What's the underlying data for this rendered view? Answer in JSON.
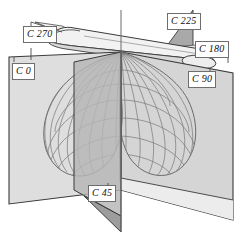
{
  "figure": {
    "background_color": "#ffffff",
    "line_color": "#3a3a3a",
    "mesh_color": "#7b7b7b",
    "plane_fill_light": "#dedede",
    "plane_fill_mid": "#c9c9c9",
    "plane_fill_dark": "#a9a9a9",
    "luminaire_fill": "#e3e3e3"
  },
  "labels": [
    {
      "id": "c270",
      "text": "C 270",
      "x": 23,
      "y": 30
    },
    {
      "id": "c225",
      "text": "C 225",
      "x": 168,
      "y": 17
    },
    {
      "id": "c180",
      "text": "C 180",
      "x": 196,
      "y": 45
    },
    {
      "id": "c0",
      "text": "C 0",
      "x": 13,
      "y": 68
    },
    {
      "id": "c90",
      "text": "C 90",
      "x": 190,
      "y": 75
    },
    {
      "id": "c45",
      "text": "C 45",
      "x": 89,
      "y": 189
    }
  ],
  "planes": [
    {
      "id": "c0-plane",
      "name": "C 0 plane",
      "orientation": "vertical-left-facing",
      "fill": "#dedede"
    },
    {
      "id": "c90-plane",
      "name": "C 90 plane",
      "orientation": "vertical-right-facing",
      "fill": "#d4d4d4"
    },
    {
      "id": "c45-plane",
      "name": "C 45 plane",
      "orientation": "vertical-front",
      "fill": "#b2b2b2"
    },
    {
      "id": "c225-plane",
      "name": "C 225 plane",
      "orientation": "vertical-rear",
      "fill": "#a9a9a9"
    },
    {
      "id": "c180-plane",
      "name": "C 180 plane",
      "orientation": "horizontal-right",
      "fill": "#e6e6e6"
    },
    {
      "id": "c270-plane",
      "name": "C 270 plane",
      "orientation": "horizontal-left",
      "fill": "#ededed"
    }
  ],
  "axis": {
    "name": "vertical-polar-axis",
    "top": 10,
    "bottom": 232
  },
  "luminaire": {
    "name": "linear-luminaire",
    "type": "tubular-linear-fixture",
    "fill": "#ececec"
  },
  "distribution_body": {
    "name": "luminous-intensity-distribution-body",
    "shape": "butterfly-twin-lobe",
    "rendering": "wireframe-mesh",
    "meridians": 17,
    "latitudes": 9,
    "color": "#7d7d7d"
  }
}
